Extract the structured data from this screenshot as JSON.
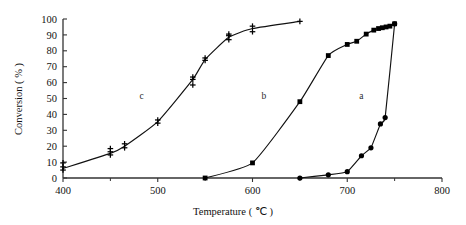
{
  "chart_data": {
    "type": "line",
    "title": "",
    "xlabel": "Temperature ( ℃ )",
    "ylabel": "Conversion ( % )",
    "xlim": [
      400,
      800
    ],
    "ylim": [
      0,
      100
    ],
    "xticks": [
      400,
      500,
      600,
      700,
      800
    ],
    "xticklabels": [
      "400",
      "500",
      "600",
      "700",
      "800"
    ],
    "xminorticks": [
      450,
      550,
      650,
      750
    ],
    "yticks": [
      0,
      10,
      20,
      30,
      40,
      50,
      60,
      70,
      80,
      90,
      100
    ],
    "yticklabels": [
      "0",
      "10",
      "20",
      "30",
      "40",
      "50",
      "60",
      "70",
      "80",
      "90",
      "100"
    ],
    "grid": false,
    "legend_position": "inline-annotations",
    "series": [
      {
        "name": "a",
        "marker": "filled-circle",
        "annotation": "a",
        "annotation_x": 715,
        "annotation_y": 50,
        "x": [
          650,
          680,
          700,
          715,
          725,
          735,
          740,
          750
        ],
        "y": [
          0,
          2,
          4,
          14,
          19,
          34,
          38,
          97
        ]
      },
      {
        "name": "b",
        "marker": "filled-square",
        "annotation": "b",
        "annotation_x": 612,
        "annotation_y": 50,
        "x": [
          550,
          600,
          650,
          680,
          700,
          710,
          720,
          728,
          733,
          737,
          741,
          745,
          750
        ],
        "y": [
          0,
          9.5,
          48,
          77,
          84,
          86,
          90.5,
          93,
          94,
          94.5,
          95,
          95.5,
          97
        ]
      },
      {
        "name": "c",
        "marker": "plus",
        "annotation": "c",
        "annotation_x": 483,
        "annotation_y": 50,
        "x": [
          400,
          450,
          465,
          500,
          537,
          550,
          575,
          600,
          650
        ],
        "y": [
          6,
          15.5,
          20,
          35.5,
          62,
          74.5,
          88.5,
          94,
          98.5
        ],
        "replicates": [
          {
            "x": 400,
            "y": [
              5,
              7,
              9.5
            ]
          },
          {
            "x": 450,
            "y": [
              14.5,
              16.5,
              18.5
            ]
          },
          {
            "x": 465,
            "y": [
              19,
              21.5
            ]
          },
          {
            "x": 500,
            "y": [
              34.5,
              36.5
            ]
          },
          {
            "x": 537,
            "y": [
              58.5,
              62,
              63.5
            ]
          },
          {
            "x": 550,
            "y": [
              74,
              75.5
            ]
          },
          {
            "x": 575,
            "y": [
              87,
              89.5,
              90.5
            ]
          },
          {
            "x": 600,
            "y": [
              92,
              95.5
            ]
          },
          {
            "x": 650,
            "y": [
              98.5
            ]
          }
        ]
      }
    ]
  },
  "figure": {
    "axis_color": "#333333",
    "curve_color": "#111111",
    "marker_color": "#000000",
    "background": "#ffffff"
  }
}
